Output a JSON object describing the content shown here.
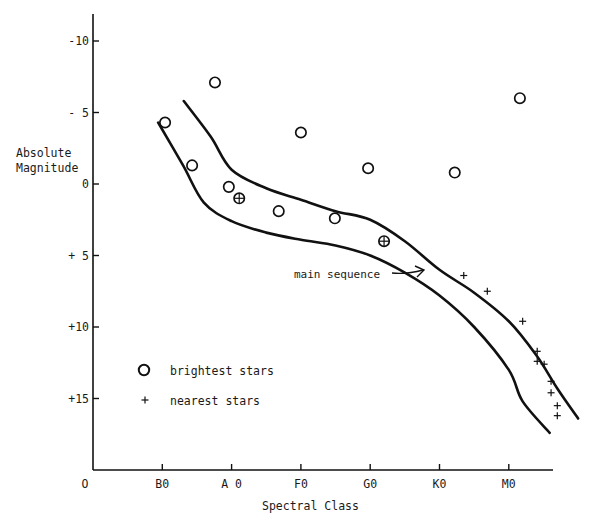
{
  "chart_data": {
    "type": "scatter",
    "title": "",
    "xlabel": "Spectral Class",
    "ylabel": "Absolute Magnitude",
    "x_ticks": [
      {
        "label": "O",
        "value": 0
      },
      {
        "label": "B0",
        "value": 1
      },
      {
        "label": "A 0",
        "value": 2
      },
      {
        "label": "F0",
        "value": 3
      },
      {
        "label": "G0",
        "value": 4
      },
      {
        "label": "K0",
        "value": 5
      },
      {
        "label": "M0",
        "value": 6
      }
    ],
    "y_ticks": [
      {
        "label": "-10",
        "value": -10
      },
      {
        "label": "- 5",
        "value": -5
      },
      {
        "label": "0",
        "value": 0
      },
      {
        "label": "+ 5",
        "value": 5
      },
      {
        "label": "+10",
        "value": 10
      },
      {
        "label": "+15",
        "value": 15
      }
    ],
    "y_inverted": true,
    "xlim": [
      0,
      7
    ],
    "ylim": [
      -11.5,
      20
    ],
    "grid": false,
    "legend_position": "lower-left-inside",
    "legend": [
      {
        "marker": "circle",
        "label": "brightest stars"
      },
      {
        "marker": "plus",
        "label": "nearest stars"
      }
    ],
    "annotations": [
      {
        "text": "main sequence",
        "arrow_to": {
          "x": 4.8,
          "y": 6.2
        }
      }
    ],
    "series": [
      {
        "name": "brightest stars",
        "marker": "circle",
        "points": [
          {
            "x": 1.04,
            "y": -4.3
          },
          {
            "x": 1.76,
            "y": -7.1
          },
          {
            "x": 1.43,
            "y": -1.3
          },
          {
            "x": 1.96,
            "y": 0.2
          },
          {
            "x": 2.68,
            "y": 1.9
          },
          {
            "x": 3.0,
            "y": -3.6
          },
          {
            "x": 3.49,
            "y": 2.4
          },
          {
            "x": 3.97,
            "y": -1.1
          },
          {
            "x": 5.22,
            "y": -0.8
          },
          {
            "x": 6.16,
            "y": -6.0
          }
        ]
      },
      {
        "name": "both (bright and nearest)",
        "marker": "circle-plus",
        "points": [
          {
            "x": 2.11,
            "y": 1.0
          },
          {
            "x": 4.2,
            "y": 4.0
          }
        ]
      },
      {
        "name": "nearest stars",
        "marker": "plus",
        "points": [
          {
            "x": 5.35,
            "y": 6.4
          },
          {
            "x": 5.69,
            "y": 7.5
          },
          {
            "x": 6.2,
            "y": 9.6
          },
          {
            "x": 6.41,
            "y": 11.7
          },
          {
            "x": 6.41,
            "y": 12.4
          },
          {
            "x": 6.51,
            "y": 12.6
          },
          {
            "x": 6.61,
            "y": 13.8
          },
          {
            "x": 6.61,
            "y": 14.6
          },
          {
            "x": 6.7,
            "y": 15.5
          },
          {
            "x": 6.7,
            "y": 16.2
          }
        ]
      }
    ],
    "band": {
      "name": "main sequence",
      "upper": [
        [
          1.31,
          -5.8
        ],
        [
          1.7,
          -3.3
        ],
        [
          2.0,
          -1.0
        ],
        [
          2.5,
          0.3
        ],
        [
          3.0,
          1.1
        ],
        [
          3.5,
          1.9
        ],
        [
          4.0,
          2.5
        ],
        [
          4.5,
          4.0
        ],
        [
          5.0,
          6.0
        ],
        [
          5.5,
          7.6
        ],
        [
          6.0,
          9.6
        ],
        [
          6.4,
          12.0
        ],
        [
          6.7,
          14.3
        ],
        [
          7.0,
          16.4
        ]
      ],
      "lower": [
        [
          0.94,
          -4.3
        ],
        [
          1.3,
          -1.3
        ],
        [
          1.6,
          1.3
        ],
        [
          2.0,
          2.6
        ],
        [
          2.5,
          3.4
        ],
        [
          3.0,
          3.9
        ],
        [
          3.5,
          4.3
        ],
        [
          4.0,
          5.0
        ],
        [
          4.5,
          6.2
        ],
        [
          5.0,
          7.8
        ],
        [
          5.5,
          10.0
        ],
        [
          6.0,
          13.0
        ],
        [
          6.2,
          15.2
        ],
        [
          6.59,
          17.4
        ]
      ]
    }
  },
  "labels": {
    "ylabel_line1": "Absolute",
    "ylabel_line2": "Magnitude",
    "xlabel": "Spectral Class",
    "annotation": "main sequence",
    "legend_circle": "brightest stars",
    "legend_plus": "nearest stars"
  }
}
